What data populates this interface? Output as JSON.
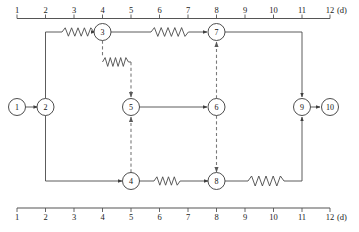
{
  "diagram": {
    "unit_label": "(d)",
    "axis": {
      "ticks": [
        "1",
        "2",
        "3",
        "4",
        "5",
        "6",
        "7",
        "8",
        "9",
        "10",
        "11",
        "12"
      ],
      "min": 1,
      "max": 12,
      "unit": "(d)"
    },
    "nodes": [
      {
        "id": "1",
        "label": "1",
        "day": 1,
        "row": "middle"
      },
      {
        "id": "2",
        "label": "2",
        "day": 2,
        "row": "middle"
      },
      {
        "id": "3",
        "label": "3",
        "day": 4,
        "row": "top"
      },
      {
        "id": "4",
        "label": "4",
        "day": 5,
        "row": "bottom"
      },
      {
        "id": "5",
        "label": "5",
        "day": 5,
        "row": "middle"
      },
      {
        "id": "6",
        "label": "6",
        "day": 8,
        "row": "middle"
      },
      {
        "id": "7",
        "label": "7",
        "day": 8,
        "row": "top"
      },
      {
        "id": "8",
        "label": "8",
        "day": 8,
        "row": "bottom"
      },
      {
        "id": "9",
        "label": "9",
        "day": 11,
        "row": "middle"
      },
      {
        "id": "10",
        "label": "10",
        "day": 12,
        "row": "middle"
      }
    ],
    "edges": [
      {
        "from": "1",
        "to": "2",
        "style": "solid",
        "arrow": true
      },
      {
        "from": "2",
        "to": "3",
        "style": "solid-wavy",
        "arrow": true
      },
      {
        "from": "3",
        "to": "7",
        "style": "solid-wavy",
        "arrow": true
      },
      {
        "from": "7",
        "to": "9",
        "style": "solid",
        "arrow": true
      },
      {
        "from": "9",
        "to": "10",
        "style": "solid",
        "arrow": true
      },
      {
        "from": "2",
        "to": "4",
        "style": "solid",
        "arrow": true
      },
      {
        "from": "4",
        "to": "8",
        "style": "solid-wavy",
        "arrow": true
      },
      {
        "from": "8",
        "to": "9",
        "style": "solid-wavy",
        "arrow": true
      },
      {
        "from": "5",
        "to": "6",
        "style": "solid",
        "arrow": true
      },
      {
        "from": "3",
        "to": "5",
        "style": "dashed-wavy",
        "arrow": true
      },
      {
        "from": "4",
        "to": "5",
        "style": "dashed",
        "arrow": true
      },
      {
        "from": "6",
        "to": "7",
        "style": "dashed",
        "arrow": true
      },
      {
        "from": "6",
        "to": "8",
        "style": "dashed",
        "arrow": true
      }
    ]
  }
}
